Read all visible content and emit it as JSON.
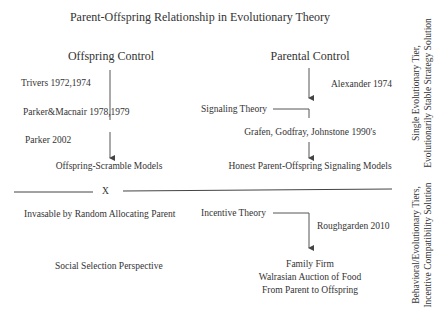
{
  "title": "Parent-Offspring Relationship in Evolutionary Theory",
  "columns": {
    "offspring": {
      "heading": "Offspring Control",
      "citations": [
        "Trivers 1972,1974",
        "Parker&Macnair 1978,1979",
        "Parker 2002"
      ],
      "result": "Offspring-Scramble Models",
      "lower": {
        "cross_marker": "X",
        "invasion_note": "Invasable by Random Allocating Parent",
        "perspective": "Social Selection Perspective"
      }
    },
    "parental": {
      "heading": "Parental Control",
      "citation_top": "Alexander 1974",
      "branch_label": "Signaling Theory",
      "citation_mid": "Grafen, Godfray, Johnstone 1990's",
      "result": "Honest Parent-Offspring Signaling Models",
      "lower": {
        "branch_label": "Incentive Theory",
        "citation": "Roughgarden 2010",
        "result_lines": [
          "Family Firm",
          "Walrasian Auction of Food",
          "From Parent to Offspring"
        ]
      }
    }
  },
  "side_labels": {
    "upper": "Single Evolutionary Tier,\nEvolutionarily Stable Strategy Solution",
    "lower": "Behavioral/Evolutionary Tiers,\nIncentive Compatibility Solution"
  },
  "colors": {
    "text": "#333333",
    "line": "#444444",
    "background": "#ffffff"
  }
}
